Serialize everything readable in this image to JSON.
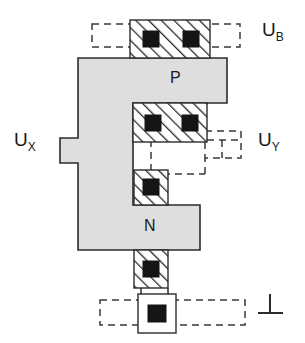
{
  "figure": {
    "kind": "semiconductor-cross-section-layout",
    "background_color": "#ffffff",
    "body_fill_color": "#dedede",
    "outline_color": "#2b2b2b",
    "contact_color": "#151515",
    "dashed_color": "#3a3a3a"
  },
  "region_labels": {
    "p_region": "P",
    "n_region": "N"
  },
  "terminals": [
    {
      "id": "u-b",
      "label": "U",
      "subscript": "B",
      "text": "U_B",
      "position": "top-right"
    },
    {
      "id": "u-x",
      "label": "U",
      "subscript": "X",
      "text": "U_X",
      "position": "left-middle"
    },
    {
      "id": "u-y",
      "label": "U",
      "subscript": "Y",
      "text": "U_Y",
      "position": "right-middle"
    },
    {
      "id": "ground",
      "label": "⊥",
      "subscript": "",
      "text": "ground",
      "position": "bottom-right"
    }
  ],
  "contacts": [
    {
      "id": "contact-top-left",
      "dots": 1,
      "group": "u-b-contact-bar"
    },
    {
      "id": "contact-top-right",
      "dots": 1,
      "group": "u-b-contact-bar"
    },
    {
      "id": "contact-mid-left",
      "dots": 1,
      "group": "u-y-contact-bar"
    },
    {
      "id": "contact-mid-right",
      "dots": 1,
      "group": "u-y-contact-bar"
    },
    {
      "id": "contact-notch",
      "dots": 1,
      "group": "inner-notch-contact"
    },
    {
      "id": "contact-bottom",
      "dots": 1,
      "group": "ground-contact"
    },
    {
      "id": "contact-ground-pad",
      "dots": 1,
      "group": "ground-pad"
    }
  ],
  "dashed_nets": [
    {
      "id": "net-u-b",
      "connects": [
        "u-b-contact-bar",
        "u-b"
      ]
    },
    {
      "id": "net-u-y",
      "connects": [
        "u-y-contact-bar",
        "inner-notch-contact",
        "u-y"
      ]
    },
    {
      "id": "net-ground",
      "connects": [
        "ground-pad",
        "ground"
      ]
    }
  ]
}
